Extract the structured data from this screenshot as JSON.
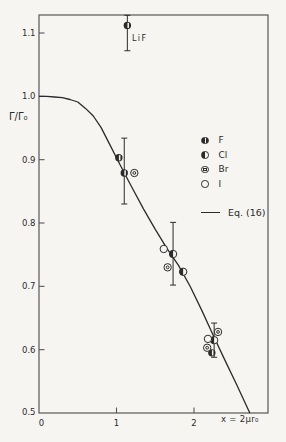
{
  "figure": {
    "paper_color": "#f6f5f1",
    "ink_color": "#2b2b2b",
    "box_color": "#575757"
  },
  "chart_data": {
    "type": "scatter",
    "title": "",
    "xlabel": "x = 2μr₀",
    "ylabel": "Γ/Γ₀",
    "xlim": [
      0,
      2.95
    ],
    "ylim": [
      0.5,
      1.128
    ],
    "grid": false,
    "legend_position": "center-right",
    "x_ticks": [
      {
        "value": 0,
        "label": "0"
      },
      {
        "value": 1,
        "label": "1"
      },
      {
        "value": 2,
        "label": "2"
      }
    ],
    "y_ticks": [
      {
        "value": 1.1,
        "label": "1.1"
      },
      {
        "value": 1.0,
        "label": "1.0"
      },
      {
        "value": 0.9,
        "label": "0.9"
      },
      {
        "value": 0.8,
        "label": "0.8"
      },
      {
        "value": 0.7,
        "label": "0.7"
      },
      {
        "value": 0.6,
        "label": "0.6"
      },
      {
        "value": 0.5,
        "label": "0.5"
      }
    ],
    "series": [
      {
        "name": "F",
        "symbol": "circle-slit",
        "points": [
          [
            1.03,
            0.903
          ],
          [
            1.1,
            0.879
          ],
          [
            2.23,
            0.595
          ]
        ]
      },
      {
        "name": "Cl",
        "symbol": "circle-half",
        "points": [
          [
            1.73,
            0.751
          ],
          [
            1.86,
            0.723
          ],
          [
            2.26,
            0.615
          ]
        ]
      },
      {
        "name": "Br",
        "symbol": "circle-dot",
        "points": [
          [
            1.23,
            0.879
          ],
          [
            1.66,
            0.73
          ],
          [
            2.17,
            0.603
          ],
          [
            2.31,
            0.628
          ]
        ]
      },
      {
        "name": "I",
        "symbol": "circle-open",
        "points": [
          [
            1.61,
            0.759
          ],
          [
            2.18,
            0.617
          ]
        ]
      }
    ],
    "labeled_point": {
      "label": "LiF",
      "series": "F",
      "point": [
        1.14,
        1.112
      ]
    },
    "error_bars": [
      {
        "x": 1.14,
        "center": 1.112,
        "low": 1.072,
        "high": 1.128
      },
      {
        "x": 1.1,
        "center": 0.879,
        "low": 0.83,
        "high": 0.934
      },
      {
        "x": 1.73,
        "center": 0.751,
        "low": 0.702,
        "high": 0.801
      },
      {
        "x": 2.26,
        "center": 0.615,
        "low": 0.588,
        "high": 0.642
      }
    ],
    "curve": {
      "label": "Eq. (16)",
      "points": [
        [
          0.0,
          1.0
        ],
        [
          0.1,
          1.0
        ],
        [
          0.2,
          0.999
        ],
        [
          0.3,
          0.998
        ],
        [
          0.4,
          0.995
        ],
        [
          0.5,
          0.991
        ],
        [
          0.6,
          0.981
        ],
        [
          0.7,
          0.969
        ],
        [
          0.8,
          0.951
        ],
        [
          0.9,
          0.927
        ],
        [
          1.0,
          0.903
        ],
        [
          1.1,
          0.879
        ],
        [
          1.2,
          0.856
        ],
        [
          1.35,
          0.822
        ],
        [
          1.5,
          0.79
        ],
        [
          1.65,
          0.76
        ],
        [
          1.8,
          0.733
        ],
        [
          1.95,
          0.7
        ],
        [
          2.1,
          0.662
        ],
        [
          2.25,
          0.622
        ],
        [
          2.4,
          0.583
        ],
        [
          2.55,
          0.545
        ],
        [
          2.72,
          0.5
        ]
      ]
    }
  }
}
